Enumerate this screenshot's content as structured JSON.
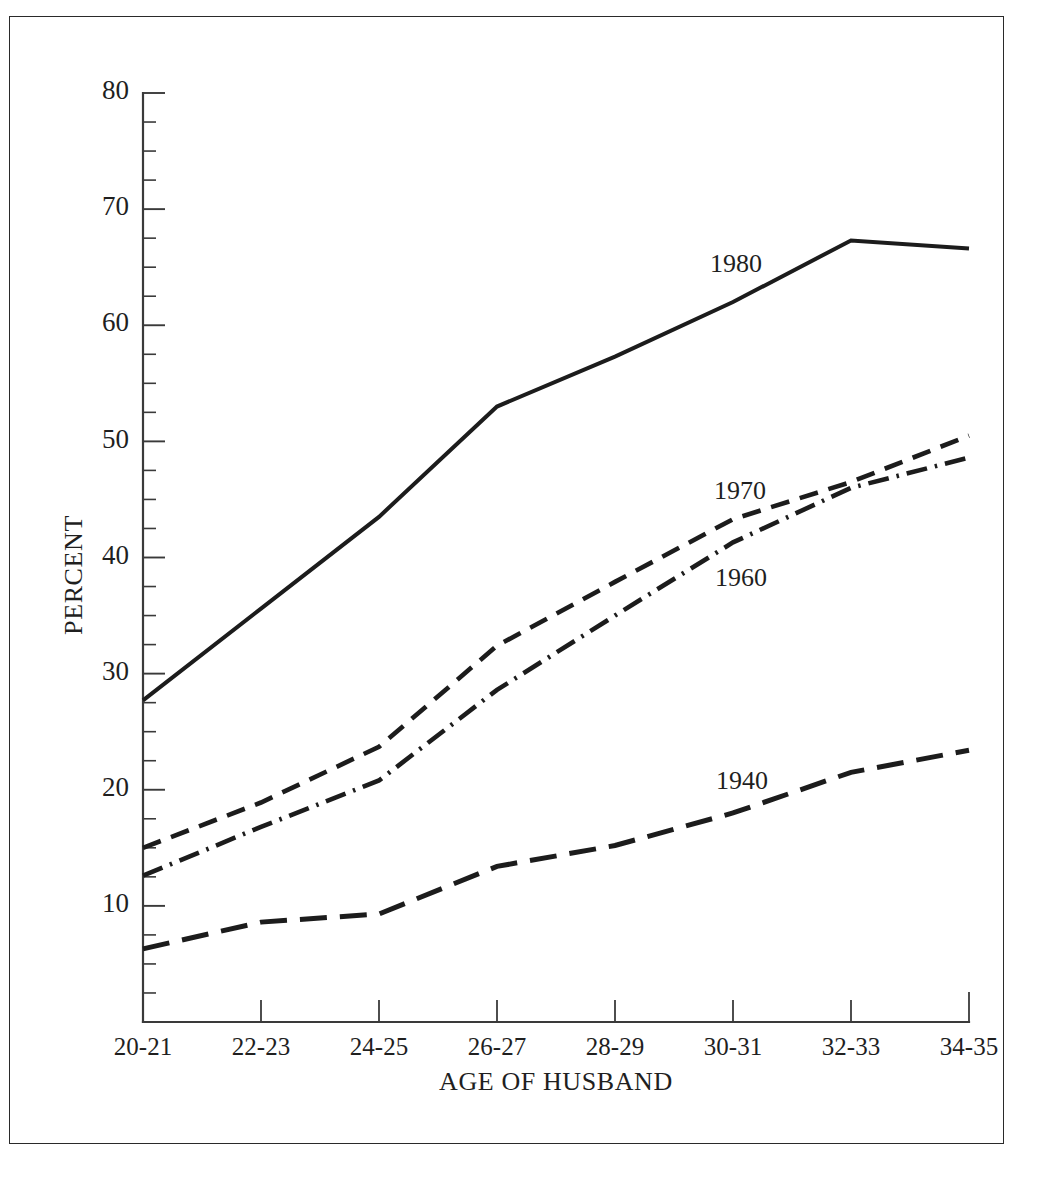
{
  "figure": {
    "background_color": "#ffffff",
    "frame_color": "#2a2a2a",
    "ink_color": "#1c1c1c"
  },
  "axes": {
    "y_title": "PERCENT",
    "x_title": "AGE OF HUSBAND",
    "y_tick_labels": [
      "10",
      "20",
      "30",
      "40",
      "50",
      "60",
      "70",
      "80"
    ],
    "x_tick_labels": [
      "20-21",
      "22-23",
      "24-25",
      "26-27",
      "28-29",
      "30-31",
      "32-33",
      "34-35"
    ]
  },
  "series_labels": {
    "s1980": "1980",
    "s1970": "1970",
    "s1960": "1960",
    "s1940": "1940"
  },
  "chart_data": {
    "type": "line",
    "title": "",
    "xlabel": "AGE OF HUSBAND",
    "ylabel": "PERCENT",
    "categories": [
      "20-21",
      "22-23",
      "24-25",
      "26-27",
      "28-29",
      "30-31",
      "32-33",
      "34-35"
    ],
    "ylim": [
      0,
      80
    ],
    "y_major_ticks": [
      10,
      20,
      30,
      40,
      50,
      60,
      70,
      80
    ],
    "y_minor_tick_step": 2.5,
    "grid": false,
    "legend": "inline-labels",
    "series": [
      {
        "name": "1980",
        "line_style": "solid",
        "values": [
          27.7,
          35.6,
          43.5,
          53.0,
          57.3,
          62.0,
          67.3,
          66.6
        ]
      },
      {
        "name": "1970",
        "line_style": "dashed",
        "values": [
          15.0,
          18.9,
          23.7,
          32.4,
          37.9,
          43.3,
          46.5,
          50.5
        ]
      },
      {
        "name": "1960",
        "line_style": "dash-dot",
        "values": [
          12.6,
          16.8,
          20.8,
          28.6,
          35.0,
          41.3,
          46.0,
          48.6
        ]
      },
      {
        "name": "1940",
        "line_style": "long-dash",
        "values": [
          6.3,
          8.6,
          9.3,
          13.4,
          15.2,
          18.0,
          21.5,
          23.4
        ]
      }
    ]
  }
}
